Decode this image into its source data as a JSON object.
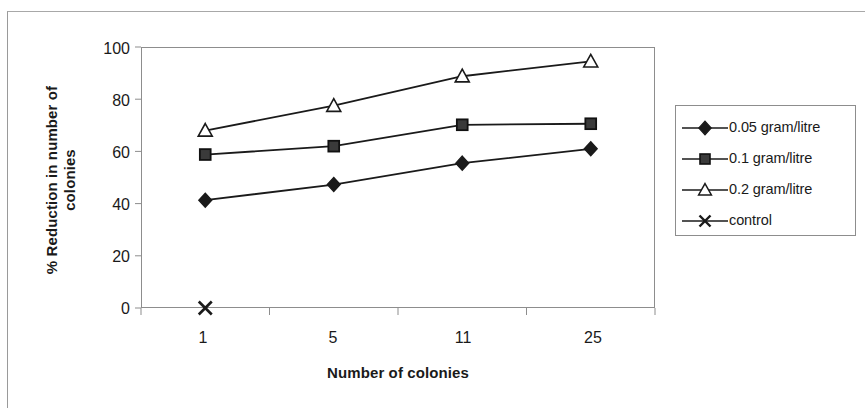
{
  "chart_data": {
    "type": "line",
    "title": "",
    "xlabel": "Number of colonies",
    "ylabel": "% Reduction in number of colonies",
    "categories": [
      "1",
      "5",
      "11",
      "25"
    ],
    "ylim": [
      0,
      100
    ],
    "ytick_labels": [
      "0",
      "20",
      "40",
      "60",
      "80",
      "100"
    ],
    "ytick_values": [
      0,
      20,
      40,
      60,
      80,
      100
    ],
    "grid": false,
    "legend_position": "right",
    "series": [
      {
        "name": "0.05 gram/litre",
        "marker": "filled-diamond",
        "color": "#1a1a1a",
        "values": [
          41.3,
          47.3,
          55.5,
          61.0
        ]
      },
      {
        "name": "0.1 gram/litre",
        "marker": "filled-square",
        "color": "#1a1a1a",
        "values": [
          58.8,
          62.0,
          70.2,
          70.6
        ]
      },
      {
        "name": "0.2 gram/litre",
        "marker": "open-triangle",
        "color": "#1a1a1a",
        "values": [
          68.0,
          77.5,
          88.8,
          94.5
        ]
      },
      {
        "name": "control",
        "marker": "cross",
        "color": "#1a1a1a",
        "values": [
          0,
          null,
          null,
          null
        ]
      }
    ]
  },
  "axes": {
    "y_title_line1": "% Reduction in number of",
    "y_title_line2": "colonies",
    "x_title": "Number of colonies"
  },
  "legend": {
    "items": [
      {
        "label": "0.05 gram/litre",
        "marker": "filled-diamond"
      },
      {
        "label": "0.1 gram/litre",
        "marker": "filled-square"
      },
      {
        "label": "0.2 gram/litre",
        "marker": "open-triangle"
      },
      {
        "label": "control",
        "marker": "cross"
      }
    ]
  },
  "colors": {
    "ink": "#1a1a1a",
    "axis": "#8d8d8d",
    "page_rule": "#a8a8a8",
    "background": "#ffffff"
  }
}
